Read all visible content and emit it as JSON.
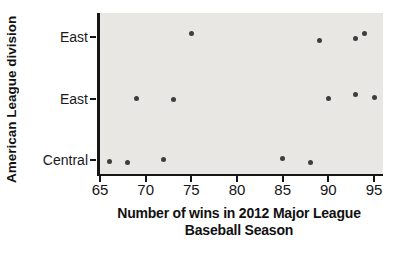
{
  "chart_data": {
    "type": "scatter",
    "title": "",
    "xlabel_line1": "Number of wins in 2012 Major League",
    "xlabel_line2": "Baseball Season",
    "ylabel": "American League division",
    "xlim": [
      65,
      96
    ],
    "xticks": [
      65,
      70,
      75,
      80,
      85,
      90,
      95
    ],
    "grid": false,
    "legend": "none",
    "plot_bg": "#e8e7e4",
    "dot_color": "#3e3e3e",
    "rows": [
      {
        "label": "East",
        "wins": [
          75,
          89,
          93,
          94
        ],
        "dy": [
          -4,
          3,
          1,
          -4
        ]
      },
      {
        "label": "East",
        "wins": [
          69,
          73,
          90,
          93,
          95
        ],
        "dy": [
          -1,
          0,
          -1,
          -5,
          -2
        ]
      },
      {
        "label": "Central",
        "wins": [
          66,
          68,
          72,
          85,
          88
        ],
        "dy": [
          1,
          2,
          -1,
          -2,
          2
        ]
      }
    ]
  }
}
